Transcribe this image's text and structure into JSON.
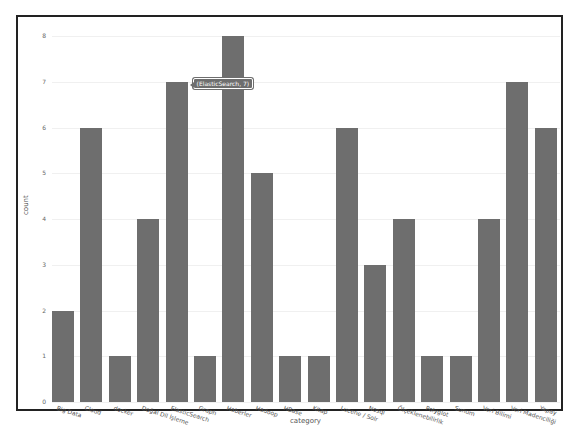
{
  "chart_data": {
    "type": "bar",
    "title": "",
    "xlabel": "category",
    "ylabel": "count",
    "ylim": [
      0,
      8
    ],
    "yticks": [
      0,
      1,
      2,
      3,
      4,
      5,
      6,
      7,
      8
    ],
    "grid": true,
    "categories": [
      "Big Data",
      "Cloud",
      "docker",
      "Doğal Dil İşleme",
      "ElasticSearch",
      "Graph",
      "Haberler",
      "Hadoop",
      "HBase",
      "Kitap",
      "Lucene / Solr",
      "Nosql",
      "Ölçeklenebilirlik",
      "Polyglot",
      "Sunum",
      "Veri Bilimi",
      "Veri Madenciliği",
      "Yapay"
    ],
    "values": [
      2,
      6,
      1,
      4,
      7,
      1,
      8,
      5,
      1,
      1,
      6,
      3,
      4,
      1,
      1,
      4,
      7,
      6
    ],
    "bar_color": "#6e6e6e",
    "tooltip": {
      "text": "(ElasticSearch, 7)",
      "category_index": 4
    }
  }
}
